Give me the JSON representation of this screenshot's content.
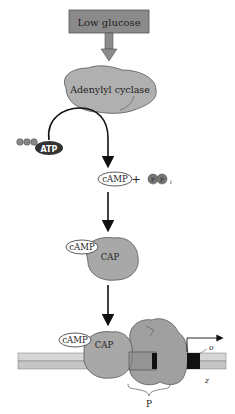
{
  "diagram": {
    "title_box": "Low glucose",
    "enzyme": "Adenylyl cyclase",
    "substrate": "ATP",
    "product_camp": "cAMP",
    "plus": "+",
    "pyrophosphate_p1": "P",
    "pyrophosphate_p2": "P",
    "pyrophosphate_sub": "i",
    "complex_camp": "cAMP",
    "complex_cap": "CAP",
    "dna_camp": "cAMP",
    "dna_cap": "CAP",
    "promoter_label": "P",
    "operator_label": "o",
    "gene_label": "z"
  },
  "colors": {
    "box_fill": "#8a8a8a",
    "protein_fill": "#a8a8a8",
    "protein_stroke": "#555555",
    "dna_light": "#d4d4d4",
    "dna_dark": "#b8b8b8",
    "arrow": "#111111",
    "operator_fill": "#111111"
  }
}
